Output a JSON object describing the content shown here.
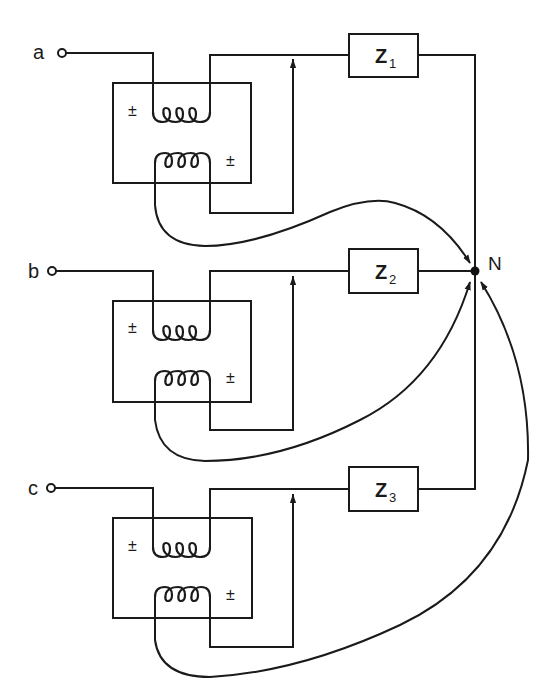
{
  "diagram": {
    "type": "three-phase wye-connected circuit with current/voltage transformer sources",
    "colors": {
      "line": "#1a1a1a",
      "background": "#ffffff"
    },
    "neutral_node": {
      "label": "N"
    },
    "phases": [
      {
        "terminal": "a",
        "impedance": {
          "symbol": "Z",
          "subscript": "1"
        },
        "polarity_marks": [
          "±",
          "±"
        ]
      },
      {
        "terminal": "b",
        "impedance": {
          "symbol": "Z",
          "subscript": "2"
        },
        "polarity_marks": [
          "±",
          "±"
        ]
      },
      {
        "terminal": "c",
        "impedance": {
          "symbol": "Z",
          "subscript": "3"
        },
        "polarity_marks": [
          "±",
          "±"
        ]
      }
    ]
  }
}
